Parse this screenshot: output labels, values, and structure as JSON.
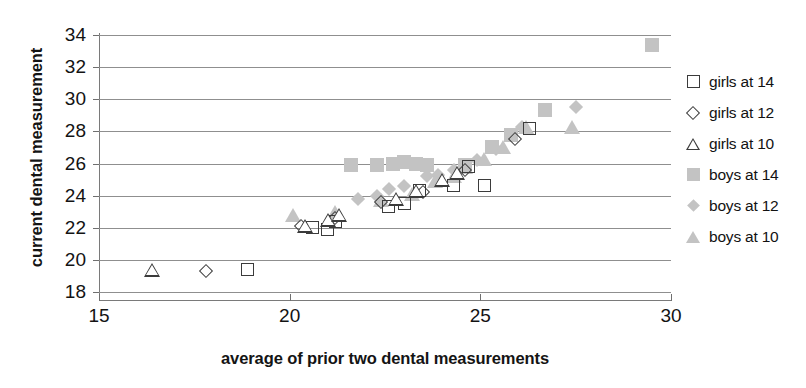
{
  "chart_data": {
    "type": "scatter",
    "title": "",
    "xlabel": "average of prior two dental measurements",
    "ylabel": "current dental measurement",
    "xlim": [
      15,
      30
    ],
    "ylim": [
      18,
      34
    ],
    "xticks": [
      15,
      20,
      25,
      30
    ],
    "yticks": [
      18,
      20,
      22,
      24,
      26,
      28,
      30,
      32,
      34
    ],
    "grid": "horizontal",
    "legend_position": "right",
    "marker_fill_gray": "#c3c3c3",
    "marker_outline": "#3b3b3b",
    "series": [
      {
        "name": "girls at 14",
        "marker": "square-open",
        "points": [
          [
            18.9,
            19.4
          ],
          [
            20.6,
            22.0
          ],
          [
            21.0,
            21.9
          ],
          [
            21.2,
            22.4
          ],
          [
            22.6,
            23.3
          ],
          [
            23.0,
            23.5
          ],
          [
            23.4,
            24.3
          ],
          [
            24.3,
            24.6
          ],
          [
            24.7,
            25.8
          ],
          [
            25.1,
            24.6
          ],
          [
            26.3,
            28.2
          ]
        ]
      },
      {
        "name": "girls at 12",
        "marker": "diamond-open",
        "points": [
          [
            17.8,
            19.3
          ],
          [
            20.3,
            22.1
          ],
          [
            21.2,
            22.6
          ],
          [
            22.4,
            23.6
          ],
          [
            23.5,
            24.2
          ],
          [
            24.6,
            25.6
          ],
          [
            25.9,
            27.5
          ]
        ]
      },
      {
        "name": "girls at 10",
        "marker": "triangle-open",
        "points": [
          [
            16.4,
            19.4
          ],
          [
            20.4,
            22.1
          ],
          [
            21.0,
            22.5
          ],
          [
            21.3,
            22.8
          ],
          [
            22.8,
            23.8
          ],
          [
            23.3,
            24.3
          ],
          [
            24.0,
            25.0
          ],
          [
            24.4,
            25.4
          ]
        ]
      },
      {
        "name": "boys at 14",
        "marker": "square-fill",
        "points": [
          [
            21.6,
            25.9
          ],
          [
            22.3,
            25.9
          ],
          [
            22.7,
            26.0
          ],
          [
            23.0,
            26.1
          ],
          [
            23.3,
            26.0
          ],
          [
            23.6,
            25.9
          ],
          [
            24.6,
            25.9
          ],
          [
            25.3,
            27.0
          ],
          [
            25.8,
            27.8
          ],
          [
            26.7,
            29.3
          ],
          [
            29.5,
            33.4
          ]
        ]
      },
      {
        "name": "boys at 12",
        "marker": "diamond-fill",
        "points": [
          [
            21.8,
            23.8
          ],
          [
            22.3,
            24.0
          ],
          [
            22.6,
            24.4
          ],
          [
            23.0,
            24.6
          ],
          [
            23.6,
            25.2
          ],
          [
            23.9,
            25.3
          ],
          [
            24.3,
            25.6
          ],
          [
            24.9,
            26.2
          ],
          [
            25.4,
            26.9
          ],
          [
            26.1,
            28.3
          ],
          [
            27.5,
            29.5
          ]
        ]
      },
      {
        "name": "boys at 10",
        "marker": "triangle-fill",
        "points": [
          [
            20.1,
            22.8
          ],
          [
            21.2,
            23.0
          ],
          [
            22.4,
            23.7
          ],
          [
            23.2,
            24.1
          ],
          [
            23.8,
            24.9
          ],
          [
            24.3,
            25.2
          ],
          [
            24.6,
            25.8
          ],
          [
            25.1,
            26.3
          ],
          [
            25.6,
            27.0
          ],
          [
            26.2,
            28.3
          ],
          [
            27.4,
            28.3
          ]
        ]
      }
    ]
  },
  "axes": {
    "y_title": "current dental measurement",
    "x_title": "average of prior two dental measurements",
    "y_tick_labels": [
      "34",
      "32",
      "30",
      "28",
      "26",
      "24",
      "22",
      "20",
      "18"
    ],
    "x_tick_labels": [
      "15",
      "20",
      "25",
      "30"
    ]
  },
  "legend": {
    "entries": [
      {
        "label": "girls at 14",
        "marker": "square-open"
      },
      {
        "label": "girls at 12",
        "marker": "diamond-open"
      },
      {
        "label": "girls at 10",
        "marker": "triangle-open"
      },
      {
        "label": "boys at 14",
        "marker": "square-fill"
      },
      {
        "label": "boys at 12",
        "marker": "diamond-fill"
      },
      {
        "label": "boys at 10",
        "marker": "triangle-fill"
      }
    ]
  }
}
